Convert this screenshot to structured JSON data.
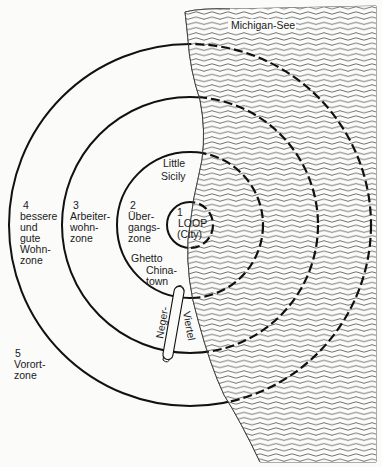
{
  "diagram": {
    "lake_label": "Michigan-See",
    "zones": [
      {
        "number": "1",
        "lines": [
          "LOOP",
          "(City)"
        ]
      },
      {
        "number": "2",
        "lines": [
          "Über-",
          "gangs-",
          "zone"
        ]
      },
      {
        "number": "3",
        "lines": [
          "Arbeiter-",
          "wohn-",
          "zone"
        ]
      },
      {
        "number": "4",
        "lines": [
          "bessere",
          "und",
          "gute",
          "Wohn-",
          "zone"
        ]
      },
      {
        "number": "5",
        "lines": [
          "Vorort-",
          "zone"
        ]
      }
    ],
    "districts": {
      "little_sicily": [
        "Little",
        "Sicily"
      ],
      "ghetto": "Ghetto",
      "chinatown": [
        "China-",
        "town"
      ],
      "neger_viertel": [
        "Neger-",
        "Viertel"
      ]
    }
  }
}
